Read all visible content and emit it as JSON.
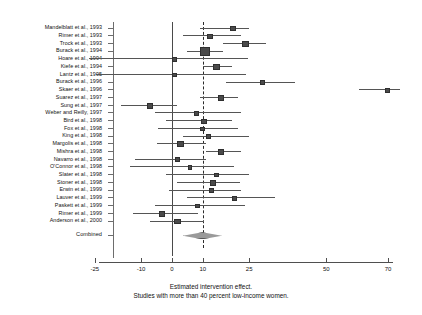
{
  "chart_data": {
    "type": "forest",
    "title": "",
    "xlabel": "Estimated intervention effect.",
    "sublabel": "Studies with more than 40 percent low-income women.",
    "xlim": [
      -28,
      74
    ],
    "xticks": [
      -25,
      -10,
      0,
      10,
      25,
      50,
      70
    ],
    "xtick_labels": [
      "-25",
      "-10",
      "0",
      "10",
      "25",
      "50",
      "70"
    ],
    "null_line": 0,
    "pooled_line": 10,
    "grid": false,
    "legend": "none",
    "ylabel": "",
    "categories": [
      "Mandelblatt et al., 1993",
      "Rimer et al., 1993",
      "Trock et al., 1993",
      "Burack et al., 1994",
      "Hoare et al., 1994",
      "Kiefe et al., 1994",
      "Lantz et al., 1995",
      "Burack et al., 1996",
      "Skaer et al., 1996",
      "Suarez et al., 1997",
      "Sung et al., 1997",
      "Weber and Reilly, 1997",
      "Bird et al., 1998",
      "Fox et al., 1998",
      "King et al., 1998",
      "Margolis et al., 1998",
      "Mishra et al., 1998",
      "Navarro et al., 1998",
      "O'Connor et al., 1998",
      "Slater et al., 1998",
      "Stoner et al., 1998",
      "Erwin et al., 1999",
      "Lauver et al., 1999",
      "Paskett et al., 1999",
      "Rimer et al., 1999",
      "Anderson et al., 2000",
      "Combined"
    ],
    "studies": [
      {
        "label": "Mandelblatt et al., 1993",
        "effect": 19.5,
        "ci_low": 9.0,
        "ci_high": 25.0,
        "weight": 2
      },
      {
        "label": "Rimer et al., 1993",
        "effect": 12.0,
        "ci_low": 3.5,
        "ci_high": 22.5,
        "weight": 2
      },
      {
        "label": "Trock et al., 1993",
        "effect": 23.5,
        "ci_low": 16.5,
        "ci_high": 30.5,
        "weight": 4
      },
      {
        "label": "Burack et al., 1994",
        "effect": 10.5,
        "ci_low": 5.0,
        "ci_high": 16.5,
        "weight": 7
      },
      {
        "label": "Hoare et al., 1994",
        "effect": 0.5,
        "ci_low": -27.0,
        "ci_high": 24.5,
        "weight": 1
      },
      {
        "label": "Kiefe et al., 1994",
        "effect": 14.0,
        "ci_low": 10.0,
        "ci_high": 19.5,
        "weight": 4
      },
      {
        "label": "Lantz et al., 1995",
        "effect": 0.5,
        "ci_low": -24.5,
        "ci_high": 24.0,
        "weight": 1
      },
      {
        "label": "Burack et al., 1996",
        "effect": 29.0,
        "ci_low": 17.5,
        "ci_high": 40.0,
        "weight": 1
      },
      {
        "label": "Skaer et al., 1996",
        "effect": 69.5,
        "ci_low": 60.5,
        "ci_high": 74.0,
        "weight": 1
      },
      {
        "label": "Suarez et al., 1997",
        "effect": 15.5,
        "ci_low": 9.0,
        "ci_high": 21.5,
        "weight": 3
      },
      {
        "label": "Sung et al., 1997",
        "effect": -7.5,
        "ci_low": -16.5,
        "ci_high": 1.5,
        "weight": 3
      },
      {
        "label": "Weber and Reilly, 1997",
        "effect": 7.5,
        "ci_low": -5.5,
        "ci_high": 22.5,
        "weight": 1
      },
      {
        "label": "Bird et al., 1998",
        "effect": 10.0,
        "ci_low": -2.0,
        "ci_high": 19.5,
        "weight": 2
      },
      {
        "label": "Fox et al., 1998",
        "effect": 9.5,
        "ci_low": -4.5,
        "ci_high": 21.5,
        "weight": 1
      },
      {
        "label": "King et al., 1998",
        "effect": 11.5,
        "ci_low": 3.5,
        "ci_high": 25.0,
        "weight": 1
      },
      {
        "label": "Margolis et al., 1998",
        "effect": 2.5,
        "ci_low": -5.0,
        "ci_high": 11.0,
        "weight": 3
      },
      {
        "label": "Mishra et al., 1998",
        "effect": 15.5,
        "ci_low": 11.0,
        "ci_high": 22.5,
        "weight": 3
      },
      {
        "label": "Navarro et al., 1998",
        "effect": 1.5,
        "ci_low": -12.0,
        "ci_high": 11.0,
        "weight": 2
      },
      {
        "label": "O'Connor et al., 1998",
        "effect": 5.5,
        "ci_low": -13.5,
        "ci_high": 20.0,
        "weight": 1
      },
      {
        "label": "Slater et al., 1998",
        "effect": 14.0,
        "ci_low": -2.0,
        "ci_high": 25.0,
        "weight": 1
      },
      {
        "label": "Stoner et al., 1998",
        "effect": 13.0,
        "ci_low": 1.5,
        "ci_high": 22.0,
        "weight": 3
      },
      {
        "label": "Erwin et al., 1999",
        "effect": 12.5,
        "ci_low": -1.0,
        "ci_high": 22.5,
        "weight": 2
      },
      {
        "label": "Lauver et al., 1999",
        "effect": 20.0,
        "ci_low": 5.0,
        "ci_high": 33.5,
        "weight": 1
      },
      {
        "label": "Paskett et al., 1999",
        "effect": 8.0,
        "ci_low": -5.5,
        "ci_high": 23.5,
        "weight": 1
      },
      {
        "label": "Rimer et al., 1999",
        "effect": -3.5,
        "ci_low": -12.5,
        "ci_high": 8.5,
        "weight": 3
      },
      {
        "label": "Anderson et al., 2000",
        "effect": 1.5,
        "ci_low": -7.0,
        "ci_high": 10.5,
        "weight": 3
      }
    ],
    "combined": {
      "label": "Combined",
      "effect": 10.0,
      "ci_low": 3.5,
      "ci_high": 15.5
    }
  }
}
